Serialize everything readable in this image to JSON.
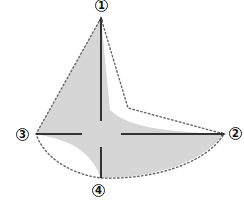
{
  "diagram": {
    "type": "four-point axis diagram with shaded region",
    "colors": {
      "fill": "#d6d6d6",
      "axis": "#333333",
      "dotted": "#666666",
      "label_border": "#222222"
    },
    "points": [
      {
        "id": "1",
        "label": "1",
        "position": "top"
      },
      {
        "id": "2",
        "label": "2",
        "position": "right"
      },
      {
        "id": "3",
        "label": "3",
        "position": "left"
      },
      {
        "id": "4",
        "label": "4",
        "position": "bottom"
      }
    ]
  }
}
